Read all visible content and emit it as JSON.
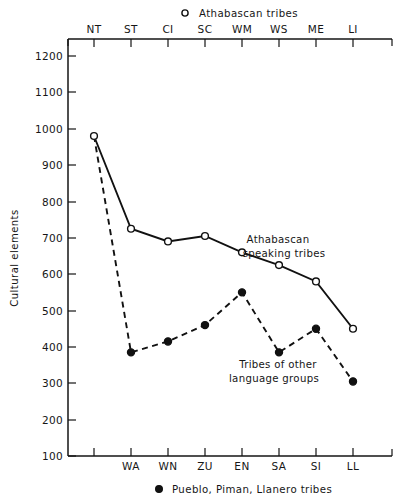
{
  "chart_data": {
    "type": "line",
    "title": "",
    "xlabel": "",
    "ylabel": "Cultural elements",
    "ylim": [
      100,
      1200
    ],
    "ytick_step": 100,
    "yticks": [
      1200,
      1100,
      1000,
      900,
      800,
      700,
      600,
      500,
      400,
      300,
      200,
      100
    ],
    "grid": false,
    "top_axis_categories": [
      "NT",
      "ST",
      "CI",
      "SC",
      "WM",
      "WS",
      "ME",
      "LI"
    ],
    "bottom_axis_categories": [
      "WA",
      "WN",
      "ZU",
      "EN",
      "SA",
      "SI",
      "LL"
    ],
    "series": [
      {
        "name": "Athabascan tribes",
        "marker": "open-circle",
        "line_style": "solid",
        "axis": "top",
        "categories": [
          "NT",
          "ST",
          "CI",
          "SC",
          "WM",
          "WS",
          "ME",
          "LI"
        ],
        "values": [
          980,
          725,
          690,
          705,
          660,
          625,
          580,
          450
        ]
      },
      {
        "name": "Pueblo, Piman, Llanero tribes",
        "marker": "filled-circle",
        "line_style": "dashed",
        "axis": "bottom",
        "categories": [
          "WA",
          "WN",
          "ZU",
          "EN",
          "SA",
          "SI",
          "LL"
        ],
        "values": [
          385,
          415,
          460,
          550,
          385,
          450,
          305
        ],
        "origin_point": {
          "label": "NT",
          "value": 980
        }
      }
    ],
    "annotations": [
      {
        "id": "annot-athabascan",
        "lines": [
          "Athabascan",
          "speaking tribes"
        ]
      },
      {
        "id": "annot-other",
        "lines": [
          "Tribes of",
          "other language groups"
        ]
      }
    ],
    "legend_position": "top and bottom, centered"
  },
  "legend": {
    "top": {
      "marker": "open-circle-marker",
      "label": "Athabascan  tribes"
    },
    "bottom": {
      "marker": "filled-circle-marker",
      "label": "Pueblo, Piman,  Llanero tribes"
    }
  },
  "annotations": {
    "athabascan": {
      "line1": "Athabascan",
      "line2": "speaking tribes"
    },
    "other": {
      "line1": "Tribes of other",
      "line2": "language groups"
    }
  },
  "axes": {
    "y_title": "Cultural elements",
    "y_ticks": [
      "1200",
      "1100",
      "1000",
      "900",
      "800",
      "700",
      "600",
      "500",
      "400",
      "300",
      "200",
      "100"
    ],
    "top_ticks": [
      "NT",
      "ST",
      "CI",
      "SC",
      "WM",
      "WS",
      "ME",
      "LI"
    ],
    "bottom_ticks": [
      "WA",
      "WN",
      "ZU",
      "EN",
      "SA",
      "SI",
      "LL"
    ]
  },
  "colors": {
    "ink": "#111111",
    "background": "#ffffff"
  }
}
